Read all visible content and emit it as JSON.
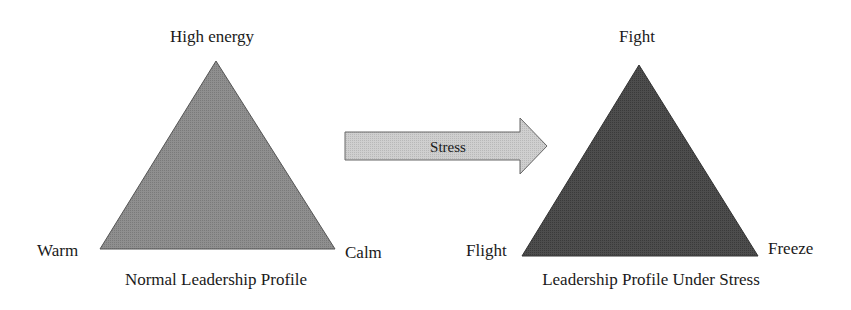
{
  "diagram": {
    "left_triangle": {
      "title": "Normal Leadership Profile",
      "apex_label": "High energy",
      "left_label": "Warm",
      "right_label": "Calm",
      "fill": "#8c8c8c"
    },
    "arrow": {
      "label": "Stress",
      "fill": "#c8c8c8"
    },
    "right_triangle": {
      "title": "Leadership Profile Under Stress",
      "apex_label": "Fight",
      "left_label": "Flight",
      "right_label": "Freeze",
      "fill": "#4a4a4a"
    }
  }
}
